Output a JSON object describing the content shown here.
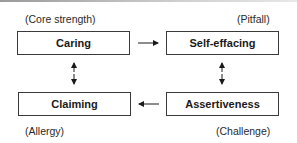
{
  "diagram": {
    "quadrants": {
      "top_left": {
        "category": "(Core strength)",
        "quality": "Caring"
      },
      "top_right": {
        "category": "(Pitfall)",
        "quality": "Self-effacing"
      },
      "bottom_right": {
        "category": "(Challenge)",
        "quality": "Assertiveness"
      },
      "bottom_left": {
        "category": "(Allergy)",
        "quality": "Claiming"
      }
    },
    "connections": [
      {
        "from": "Caring",
        "to": "Self-effacing",
        "type": "one-way"
      },
      {
        "from": "Self-effacing",
        "to": "Assertiveness",
        "type": "two-way"
      },
      {
        "from": "Assertiveness",
        "to": "Claiming",
        "type": "one-way"
      },
      {
        "from": "Claiming",
        "to": "Caring",
        "type": "two-way"
      }
    ]
  }
}
